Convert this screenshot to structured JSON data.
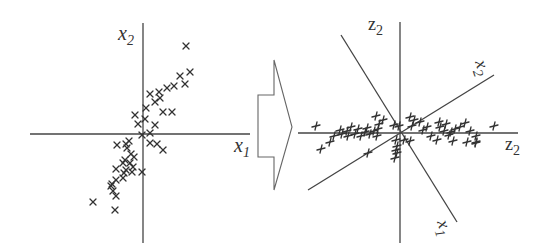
{
  "figure": {
    "left_panel": {
      "x_axis_label": "x",
      "x_axis_sub": "1",
      "y_axis_label": "x",
      "y_axis_sub": "2",
      "marker": "x",
      "points": [
        [
          186,
          46
        ],
        [
          190,
          72
        ],
        [
          180,
          76
        ],
        [
          174,
          86
        ],
        [
          185,
          84
        ],
        [
          150,
          94
        ],
        [
          159,
          92
        ],
        [
          167,
          88
        ],
        [
          160,
          98
        ],
        [
          155,
          102
        ],
        [
          163,
          112
        ],
        [
          172,
          112
        ],
        [
          146,
          108
        ],
        [
          135,
          115
        ],
        [
          145,
          119
        ],
        [
          138,
          124
        ],
        [
          155,
          125
        ],
        [
          142,
          135
        ],
        [
          150,
          133
        ],
        [
          117,
          145
        ],
        [
          126,
          144
        ],
        [
          129,
          141
        ],
        [
          150,
          143
        ],
        [
          157,
          144
        ],
        [
          163,
          150
        ],
        [
          127,
          148
        ],
        [
          131,
          154
        ],
        [
          134,
          157
        ],
        [
          125,
          160
        ],
        [
          123,
          163
        ],
        [
          130,
          163
        ],
        [
          133,
          167
        ],
        [
          126,
          170
        ],
        [
          116,
          169
        ],
        [
          124,
          173
        ],
        [
          132,
          172
        ],
        [
          142,
          172
        ],
        [
          116,
          180
        ],
        [
          112,
          184
        ],
        [
          123,
          178
        ],
        [
          111,
          186
        ],
        [
          113,
          191
        ],
        [
          116,
          196
        ],
        [
          93,
          202
        ],
        [
          115,
          210
        ]
      ]
    },
    "arrow": {
      "direction": "right"
    },
    "right_panel": {
      "vertical_axis_label": "z",
      "vertical_axis_sub": "2",
      "horizontal_axis_label": "z",
      "horizontal_axis_sub": "2",
      "rotated_x2_label": "x",
      "rotated_x2_sub": "2",
      "rotated_x1_label": "x",
      "rotated_x1_sub": "1",
      "marker": "+",
      "points": [
        [
          316,
          126
        ],
        [
          321,
          149
        ],
        [
          330,
          142
        ],
        [
          334,
          136
        ],
        [
          340,
          130
        ],
        [
          342,
          134
        ],
        [
          347,
          131
        ],
        [
          351,
          127
        ],
        [
          348,
          136
        ],
        [
          355,
          134
        ],
        [
          358,
          129
        ],
        [
          361,
          136
        ],
        [
          365,
          132
        ],
        [
          367,
          128
        ],
        [
          370,
          134
        ],
        [
          374,
          131
        ],
        [
          377,
          136
        ],
        [
          378,
          129
        ],
        [
          379,
          124
        ],
        [
          376,
          116
        ],
        [
          383,
          120
        ],
        [
          368,
          153
        ],
        [
          394,
          125
        ],
        [
          399,
          126
        ],
        [
          396,
          140
        ],
        [
          397,
          146
        ],
        [
          396,
          150
        ],
        [
          397,
          153
        ],
        [
          395,
          158
        ],
        [
          404,
          140
        ],
        [
          410,
          141
        ],
        [
          412,
          126
        ],
        [
          414,
          120
        ],
        [
          410,
          117
        ],
        [
          420,
          122
        ],
        [
          423,
          130
        ],
        [
          427,
          127
        ],
        [
          431,
          136
        ],
        [
          437,
          140
        ],
        [
          440,
          127
        ],
        [
          439,
          122
        ],
        [
          446,
          124
        ],
        [
          444,
          131
        ],
        [
          449,
          135
        ],
        [
          451,
          132
        ],
        [
          453,
          141
        ],
        [
          455,
          129
        ],
        [
          460,
          127
        ],
        [
          465,
          123
        ],
        [
          470,
          131
        ],
        [
          476,
          136
        ],
        [
          467,
          142
        ],
        [
          476,
          142
        ],
        [
          494,
          126
        ],
        [
          476,
          143
        ]
      ]
    }
  }
}
